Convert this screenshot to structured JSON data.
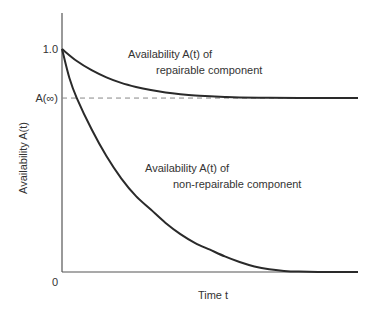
{
  "chart_data": {
    "type": "line",
    "title": "",
    "xlabel": "Time t",
    "ylabel": "Availability A(t)",
    "xlim": [
      0,
      10
    ],
    "ylim": [
      0,
      1.0
    ],
    "grid": false,
    "y_ticks": [
      {
        "value": 1.0,
        "label": "1.0"
      },
      {
        "value": 0.78,
        "label": "A(∞)"
      },
      {
        "value": 0,
        "label": "0"
      }
    ],
    "reference_lines": [
      {
        "name": "steady-state-availability",
        "y": 0.78,
        "style": "dashed",
        "label": "A(∞)"
      }
    ],
    "series": [
      {
        "name": "Availability A(t) of repairable component",
        "label_lines": [
          "Availability A(t) of",
          "repairable component"
        ],
        "x": [
          0,
          0.5,
          1,
          1.5,
          2,
          2.5,
          3,
          3.5,
          4,
          4.5,
          5,
          5.5,
          6,
          7,
          8,
          9,
          10
        ],
        "values": [
          1.0,
          0.946,
          0.905,
          0.873,
          0.848,
          0.83,
          0.816,
          0.805,
          0.797,
          0.791,
          0.788,
          0.785,
          0.783,
          0.781,
          0.78,
          0.78,
          0.78
        ]
      },
      {
        "name": "Availability A(t) of non-repairable component",
        "label_lines": [
          "Availability A(t) of",
          "non-repairable component"
        ],
        "x": [
          0,
          0.25,
          0.5,
          1,
          1.5,
          2,
          2.5,
          3,
          3.5,
          4,
          4.5,
          5,
          5.5,
          6,
          6.5,
          7,
          7.5,
          8,
          9,
          10
        ],
        "values": [
          1.0,
          0.87,
          0.78,
          0.64,
          0.52,
          0.42,
          0.34,
          0.28,
          0.22,
          0.17,
          0.13,
          0.1,
          0.07,
          0.045,
          0.025,
          0.012,
          0.005,
          0.002,
          0.0,
          0.0
        ]
      }
    ]
  }
}
